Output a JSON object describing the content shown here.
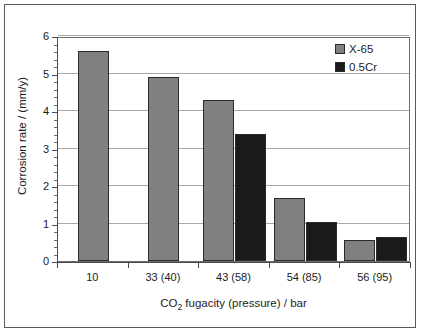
{
  "chart_data": {
    "type": "bar",
    "title": "",
    "subtitle": "",
    "xlabel": "CO2 fugacity (pressure) / bar",
    "xlabel_parts": {
      "pre": "CO",
      "sub": "2",
      "post": " fugacity (pressure) / bar"
    },
    "ylabel": "Corrosion rate / (mm/y)",
    "categories": [
      "10",
      "33 (40)",
      "43 (58)",
      "54 (85)",
      "56 (95)"
    ],
    "series": [
      {
        "name": "X-65",
        "color": "#808080",
        "values": [
          5.6,
          4.9,
          4.3,
          1.68,
          0.56
        ]
      },
      {
        "name": "0.5Cr",
        "color": "#1a1a1a",
        "values": [
          null,
          null,
          3.4,
          1.05,
          0.63
        ]
      }
    ],
    "ylim": [
      0,
      6
    ],
    "ytick_labels": [
      "0",
      "1",
      "2",
      "3",
      "4",
      "5",
      "6"
    ],
    "ytick_values": [
      0,
      1,
      2,
      3,
      4,
      5,
      6
    ],
    "y_minor_ticks_per_interval": 4,
    "grid": {
      "horizontal": true,
      "vertical": false
    },
    "legend": {
      "position": "top-right",
      "border": false
    }
  },
  "figure": {
    "border_color": "#58595b",
    "background": "#ffffff",
    "plot_border_color": "#6c6d70",
    "gridline_color": "#a6a7aa",
    "axis_color": "#4a4b4d",
    "text_color": "#1c1c1c"
  }
}
